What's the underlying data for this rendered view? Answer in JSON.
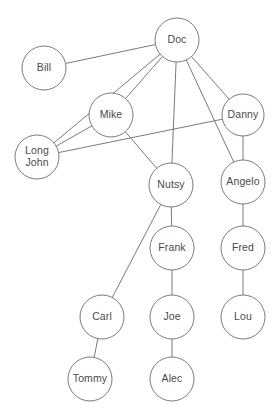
{
  "diagram": {
    "type": "node-link-graph",
    "background_color": "#ffffff",
    "node_fill_color": "#ffffff",
    "node_stroke_color": "#6b6b6b",
    "edge_color": "#6b6b6b",
    "label_color": "#4a4a4a",
    "node_radius": 22,
    "width": 280,
    "height": 417,
    "nodes": [
      {
        "id": "doc",
        "label": "Doc",
        "lines": [
          "Doc"
        ],
        "x": 177,
        "y": 40,
        "r": 22
      },
      {
        "id": "bill",
        "label": "Bill",
        "lines": [
          "Bill"
        ],
        "x": 44,
        "y": 68,
        "r": 22
      },
      {
        "id": "mike",
        "label": "Mike",
        "lines": [
          "Mike"
        ],
        "x": 111,
        "y": 115,
        "r": 22
      },
      {
        "id": "danny",
        "label": "Danny",
        "lines": [
          "Danny"
        ],
        "x": 243,
        "y": 115,
        "r": 21
      },
      {
        "id": "longjohn",
        "label": "Long John",
        "lines": [
          "Long",
          "John"
        ],
        "x": 37,
        "y": 157,
        "r": 22
      },
      {
        "id": "angelo",
        "label": "Angelo",
        "lines": [
          "Angelo"
        ],
        "x": 243,
        "y": 182,
        "r": 22
      },
      {
        "id": "nutsy",
        "label": "Nutsy",
        "lines": [
          "Nutsy"
        ],
        "x": 171,
        "y": 185,
        "r": 22
      },
      {
        "id": "frank",
        "label": "Frank",
        "lines": [
          "Frank"
        ],
        "x": 172,
        "y": 248,
        "r": 22
      },
      {
        "id": "fred",
        "label": "Fred",
        "lines": [
          "Fred"
        ],
        "x": 243,
        "y": 248,
        "r": 22
      },
      {
        "id": "carl",
        "label": "Carl",
        "lines": [
          "Carl"
        ],
        "x": 102,
        "y": 317,
        "r": 22
      },
      {
        "id": "joe",
        "label": "Joe",
        "lines": [
          "Joe"
        ],
        "x": 172,
        "y": 317,
        "r": 22
      },
      {
        "id": "lou",
        "label": "Lou",
        "lines": [
          "Lou"
        ],
        "x": 243,
        "y": 317,
        "r": 22
      },
      {
        "id": "tommy",
        "label": "Tommy",
        "lines": [
          "Tommy"
        ],
        "x": 90,
        "y": 379,
        "r": 22
      },
      {
        "id": "alec",
        "label": "Alec",
        "lines": [
          "Alec"
        ],
        "x": 172,
        "y": 379,
        "r": 22
      }
    ],
    "edges": [
      {
        "source": "doc",
        "target": "bill"
      },
      {
        "source": "doc",
        "target": "longjohn"
      },
      {
        "source": "doc",
        "target": "mike"
      },
      {
        "source": "doc",
        "target": "nutsy"
      },
      {
        "source": "doc",
        "target": "danny"
      },
      {
        "source": "doc",
        "target": "angelo"
      },
      {
        "source": "longjohn",
        "target": "mike"
      },
      {
        "source": "longjohn",
        "target": "danny"
      },
      {
        "source": "mike",
        "target": "nutsy"
      },
      {
        "source": "danny",
        "target": "angelo"
      },
      {
        "source": "angelo",
        "target": "fred"
      },
      {
        "source": "nutsy",
        "target": "frank"
      },
      {
        "source": "nutsy",
        "target": "carl"
      },
      {
        "source": "frank",
        "target": "joe"
      },
      {
        "source": "fred",
        "target": "lou"
      },
      {
        "source": "carl",
        "target": "tommy"
      },
      {
        "source": "joe",
        "target": "alec"
      }
    ]
  }
}
